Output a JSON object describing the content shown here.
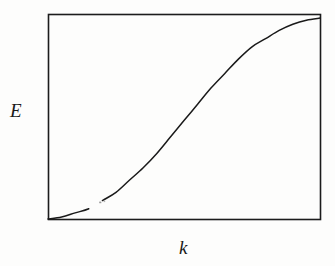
{
  "figure": {
    "type": "line-plot",
    "background_color": "#fdfdfc",
    "frame": {
      "stroke_color": "#1c1c1c",
      "stroke_width": 1.6,
      "left": 48,
      "top": 14,
      "right": 320,
      "bottom": 219
    },
    "curve": {
      "stroke_color": "#1a1a1a",
      "stroke_width": 1.5,
      "description": "sigmoid energy dispersion curve rising from bottom-left to plateau at top-right",
      "has_break_artifact": true
    }
  },
  "axes": {
    "y_label": "E",
    "x_label": "k"
  },
  "chart_data": {
    "type": "line",
    "title": "",
    "subtitle": "",
    "xlabel": "k",
    "ylabel": "E",
    "grid": false,
    "legend": null,
    "xlim": [
      0,
      1
    ],
    "ylim": [
      0,
      1
    ],
    "xticks": [],
    "yticks": [],
    "series": [
      {
        "name": "E(k)",
        "x": [
          0.0,
          0.05,
          0.1,
          0.15,
          0.2,
          0.25,
          0.3,
          0.35,
          0.4,
          0.45,
          0.5,
          0.55,
          0.6,
          0.65,
          0.7,
          0.75,
          0.8,
          0.85,
          0.9,
          0.95,
          1.0
        ],
        "y": [
          0.0,
          0.01,
          0.03,
          0.05,
          0.09,
          0.13,
          0.19,
          0.25,
          0.32,
          0.4,
          0.48,
          0.56,
          0.64,
          0.71,
          0.78,
          0.84,
          0.88,
          0.92,
          0.95,
          0.97,
          0.98
        ]
      }
    ],
    "annotations": []
  }
}
